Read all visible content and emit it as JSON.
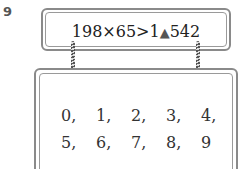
{
  "question_number": "9",
  "top_box": {
    "expression_left": "198×65>1",
    "hidden_digit_symbol": "▲",
    "expression_right": "542"
  },
  "bottom_box": {
    "options": [
      "0,",
      "1,",
      "2,",
      "3,",
      "4,",
      "5,",
      "6,",
      "7,",
      "8,",
      "9"
    ]
  }
}
